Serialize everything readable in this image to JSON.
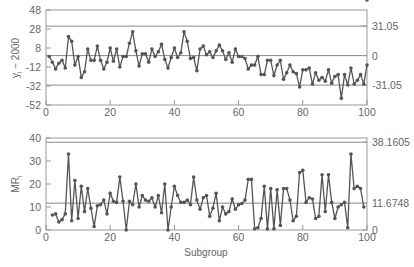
{
  "chart_data": [
    {
      "type": "line",
      "title": "Individuals control chart",
      "xlabel": "",
      "ylabel": "y_i − 2000",
      "xlim": [
        0,
        100
      ],
      "ylim": [
        -52,
        48
      ],
      "x_ticks": [
        0,
        20,
        40,
        60,
        80,
        100
      ],
      "y_ticks": [
        48,
        28,
        8,
        -12,
        -32,
        -52
      ],
      "right_labels": [
        "31.05",
        "0",
        "-31.05"
      ],
      "control_limits": {
        "UCL": 31.05,
        "CL": 0,
        "LCL": -31.05
      },
      "series": [
        {
          "name": "y_i - 2000",
          "x": [
            1,
            2,
            3,
            4,
            5,
            6,
            7,
            8,
            9,
            10,
            11,
            12,
            13,
            14,
            15,
            16,
            17,
            18,
            19,
            20,
            21,
            22,
            23,
            24,
            25,
            26,
            27,
            28,
            29,
            30,
            31,
            32,
            33,
            34,
            35,
            36,
            37,
            38,
            39,
            40,
            41,
            42,
            43,
            44,
            45,
            46,
            47,
            48,
            49,
            50,
            51,
            52,
            53,
            54,
            55,
            56,
            57,
            58,
            59,
            60,
            61,
            62,
            63,
            64,
            65,
            66,
            67,
            68,
            69,
            70,
            71,
            72,
            73,
            74,
            75,
            76,
            77,
            78,
            79,
            80,
            81,
            82,
            83,
            84,
            85,
            86,
            87,
            88,
            89,
            90,
            91,
            92,
            93,
            94,
            95,
            96,
            97,
            98,
            99,
            100
          ],
          "values": [
            -1,
            -7,
            -14,
            -8,
            -5,
            -13,
            20,
            15,
            -10,
            -1,
            -23,
            -17,
            7,
            -5,
            -5,
            10,
            -5,
            -14,
            -7,
            8,
            -6,
            7,
            -12,
            -1,
            -1,
            13,
            25,
            5,
            -11,
            2,
            2,
            -7,
            7,
            -1,
            4,
            12,
            -4,
            -13,
            -2,
            8,
            -2,
            3,
            25,
            15,
            -3,
            -2,
            -16,
            7,
            10,
            1,
            4,
            -2,
            5,
            11,
            5,
            -4,
            3,
            -7,
            7,
            -1,
            -1,
            -3,
            -14,
            -10,
            -10,
            -1,
            -20,
            -20,
            -5,
            -5,
            -21,
            -10,
            -5,
            -25,
            -18,
            -10,
            -17,
            -19,
            -33,
            -15,
            -15,
            -13,
            -30,
            -18,
            -26,
            -23,
            -27,
            -15,
            -29,
            -22,
            -20,
            -45,
            -20,
            -31,
            -13,
            -30,
            -26,
            -20,
            -30,
            -10
          ]
        }
      ]
    },
    {
      "type": "line",
      "title": "Moving range control chart",
      "xlabel": "Subgroup",
      "ylabel": "MR_i",
      "xlim": [
        0,
        100
      ],
      "ylim": [
        0,
        40
      ],
      "x_ticks": [
        0,
        20,
        40,
        60,
        80,
        100
      ],
      "y_ticks": [
        40,
        30,
        20,
        10,
        0
      ],
      "right_labels": [
        "38.1605",
        "11.6748",
        "0"
      ],
      "control_limits": {
        "UCL": 38.1605,
        "CL": 11.6748,
        "LCL": 0
      },
      "series": [
        {
          "name": "MR_i",
          "x": [
            2,
            3,
            4,
            5,
            6,
            7,
            8,
            9,
            10,
            11,
            12,
            13,
            14,
            15,
            16,
            17,
            18,
            19,
            20,
            21,
            22,
            23,
            24,
            25,
            26,
            27,
            28,
            29,
            30,
            31,
            32,
            33,
            34,
            35,
            36,
            37,
            38,
            39,
            40,
            41,
            42,
            43,
            44,
            45,
            46,
            47,
            48,
            49,
            50,
            51,
            52,
            53,
            54,
            55,
            56,
            57,
            58,
            59,
            60,
            61,
            62,
            63,
            64,
            65,
            66,
            67,
            68,
            69,
            70,
            71,
            72,
            73,
            74,
            75,
            76,
            77,
            78,
            79,
            80,
            81,
            82,
            83,
            84,
            85,
            86,
            87,
            88,
            89,
            90,
            91,
            92,
            93,
            94,
            95,
            96,
            97,
            98,
            99,
            100
          ],
          "values": [
            6.5,
            7,
            3.5,
            4.5,
            7,
            33,
            4,
            21.5,
            5,
            19,
            8,
            18,
            9.5,
            1.5,
            10.5,
            11,
            13,
            7,
            16,
            12.5,
            12,
            23,
            12.5,
            0,
            12.5,
            11,
            20,
            10,
            15,
            13,
            12.5,
            14,
            10,
            15,
            7.5,
            20,
            0,
            10,
            19,
            15,
            12,
            12,
            13,
            11,
            23,
            13,
            9,
            14,
            15,
            6,
            9.5,
            16,
            4,
            10,
            7,
            8,
            13.5,
            9,
            11,
            11.5,
            13,
            22,
            22,
            0.5,
            1,
            5,
            19,
            0.5,
            18,
            0.5,
            17.5,
            2,
            18,
            18,
            13,
            4,
            6,
            25,
            26,
            12,
            14,
            13.5,
            5,
            6,
            24,
            8,
            24,
            12,
            5,
            10,
            11,
            12,
            1,
            33,
            18,
            19,
            18,
            10
          ]
        }
      ]
    }
  ],
  "figure": {
    "axis_label_top": "y",
    "axis_label_top_sub": "i",
    "axis_label_top_rest": " − 2000",
    "axis_label_bottom": "MR",
    "axis_label_bottom_sub": "i",
    "x_axis_label": "Subgroup"
  }
}
